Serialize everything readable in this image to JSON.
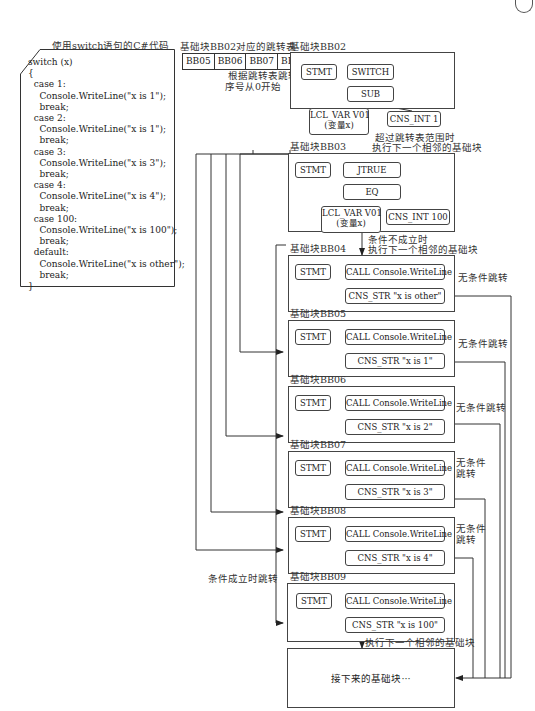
{
  "code_panel": {
    "title": "使用switch语句的C#代码",
    "lines": [
      "switch (x)",
      "{",
      "  case 1:",
      "    Console.WriteLine(\"x is 1\");",
      "    break;",
      "  case 2:",
      "    Console.WriteLine(\"x is 1\");",
      "    break;",
      "  case 3:",
      "    Console.WriteLine(\"x is 3\");",
      "    break;",
      "  case 4:",
      "    Console.WriteLine(\"x is 4\");",
      "    break;",
      "  case 100:",
      "    Console.WriteLine(\"x is 100\");",
      "    break;",
      "  default:",
      "    Console.WriteLine(\"x is other\");",
      "    break;",
      "}"
    ]
  },
  "jump_table": {
    "title": "基础块BB02对应的跳转表",
    "entries": [
      "BB05",
      "BB06",
      "BB07",
      "BB08"
    ],
    "note_line1": "根据跳转表跳转",
    "note_line2": "序号从0开始"
  },
  "blocks": {
    "bb02": {
      "title": "基础块BB02",
      "stmt": "STMT",
      "op": "SWITCH",
      "sub": "SUB",
      "lvar": "LCL_VAR V01",
      "lvar_note": "(变量x)",
      "const": "CNS_INT 1"
    },
    "bb03": {
      "title": "基础块BB03",
      "stmt": "STMT",
      "op": "JTRUE",
      "sub": "EQ",
      "lvar": "LCL_VAR V01",
      "lvar_note": "(变量x)",
      "const": "CNS_INT 100"
    },
    "bb04": {
      "title": "基础块BB04",
      "stmt": "STMT",
      "call": "CALL Console.WriteLine",
      "arg": "CNS_STR \"x is other\"",
      "jump": "无条件跳转"
    },
    "bb05": {
      "title": "基础块BB05",
      "stmt": "STMT",
      "call": "CALL Console.WriteLine",
      "arg": "CNS_STR \"x is 1\"",
      "jump": "无条件跳转"
    },
    "bb06": {
      "title": "基础块BB06",
      "stmt": "STMT",
      "call": "CALL Console.WriteLine",
      "arg": "CNS_STR \"x is 2\"",
      "jump": "无条件跳转"
    },
    "bb07": {
      "title": "基础块BB07",
      "stmt": "STMT",
      "call": "CALL Console.WriteLine",
      "arg": "CNS_STR \"x is 3\"",
      "jump_l1": "无条件",
      "jump_l2": "跳转"
    },
    "bb08": {
      "title": "基础块BB08",
      "stmt": "STMT",
      "call": "CALL Console.WriteLine",
      "arg": "CNS_STR \"x is 4\"",
      "jump_l1": "无条件",
      "jump_l2": "跳转"
    },
    "bb09": {
      "title": "基础块BB09",
      "stmt": "STMT",
      "call": "CALL Console.WriteLine",
      "arg": "CNS_STR \"x is 100\""
    }
  },
  "edges": {
    "bb02_to_bb03_l1": "超过跳转表范围时",
    "bb02_to_bb03_l2": "执行下一个相邻的基础块",
    "bb03_to_bb04_l1": "条件不成立时",
    "bb03_to_bb04_l2": "执行下一个相邻的基础块",
    "bb03_to_bb09": "条件成立时跳转",
    "bb09_to_next": "执行下一个相邻的基础块"
  },
  "next_block": {
    "label": "接下来的基础块···"
  }
}
